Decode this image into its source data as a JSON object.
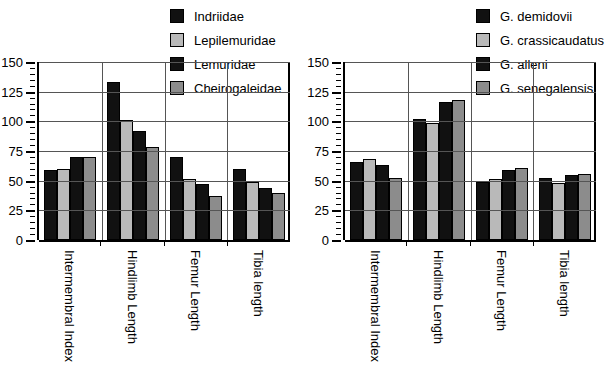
{
  "chart_data": [
    {
      "type": "bar",
      "panel": "left",
      "title": "",
      "xlabel": "",
      "ylabel": "",
      "ylim": [
        0,
        150
      ],
      "yticks": [
        0,
        25,
        50,
        75,
        100,
        125,
        150
      ],
      "minor_tick_step": 5,
      "grid": true,
      "legend_position": "top-right",
      "categories": [
        "Intermembral Index",
        "Hindlimb Length",
        "Femur Length",
        "Tibia length"
      ],
      "series": [
        {
          "name": "Indriidae",
          "color": "#111111",
          "values": [
            59,
            133,
            70,
            60
          ]
        },
        {
          "name": "Lepilemuridae",
          "color": "#b9b9b9",
          "values": [
            60,
            101,
            51,
            49
          ]
        },
        {
          "name": "Lemuridae",
          "color": "#111111",
          "values": [
            70,
            92,
            47,
            44
          ]
        },
        {
          "name": "Cheirogaleidae",
          "color": "#8c8c8c",
          "values": [
            70,
            78,
            37,
            40
          ]
        }
      ]
    },
    {
      "type": "bar",
      "panel": "right",
      "title": "",
      "xlabel": "",
      "ylabel": "",
      "ylim": [
        0,
        150
      ],
      "yticks": [
        0,
        25,
        50,
        75,
        100,
        125,
        150
      ],
      "minor_tick_step": 5,
      "grid": true,
      "legend_position": "top-right",
      "categories": [
        "Intermembral Index",
        "Hindlimb Length",
        "Femur Length",
        "Tibia length"
      ],
      "series": [
        {
          "name": "G. demidovii",
          "color": "#111111",
          "values": [
            66,
            102,
            49,
            52
          ]
        },
        {
          "name": "G. crassicaudatus",
          "color": "#b9b9b9",
          "values": [
            68,
            99,
            51,
            48
          ]
        },
        {
          "name": "G. alleni",
          "color": "#111111",
          "values": [
            63,
            116,
            59,
            55
          ]
        },
        {
          "name": "G. senegalensis",
          "color": "#8c8c8c",
          "values": [
            52,
            118,
            61,
            56
          ]
        }
      ]
    }
  ]
}
